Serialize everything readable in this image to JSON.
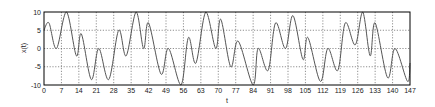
{
  "chart_data": {
    "type": "line",
    "title": "",
    "xlabel": "t",
    "ylabel": "x(t)",
    "xlim": [
      0,
      147
    ],
    "ylim": [
      -10,
      10
    ],
    "grid": true,
    "legend": null,
    "xticks": [
      0,
      7,
      14,
      21,
      28,
      35,
      42,
      49,
      56,
      63,
      70,
      77,
      84,
      91,
      98,
      105,
      112,
      119,
      126,
      133,
      140,
      147
    ],
    "yticks": [
      -10,
      -5,
      0,
      5,
      10
    ],
    "series": [
      {
        "name": "x(t)",
        "color": "#555555",
        "x": [
          0,
          2,
          5,
          9,
          13,
          15,
          19,
          22,
          26,
          30,
          33,
          37,
          40,
          42,
          47,
          50,
          55,
          58,
          61,
          65,
          69,
          71,
          75,
          78,
          84,
          86,
          90,
          93,
          97,
          100,
          104,
          106,
          111,
          114,
          118,
          121,
          125,
          128,
          131,
          133,
          138,
          141,
          146,
          147
        ],
        "y": [
          5,
          7,
          0,
          10,
          -2,
          4,
          -8.5,
          0,
          -8.5,
          5,
          -2,
          10,
          0,
          7,
          -7,
          0,
          -10,
          3,
          -4,
          10,
          0,
          8,
          -5,
          2,
          -10,
          0,
          -6,
          7,
          0,
          9,
          -3,
          3,
          -9,
          0,
          -6,
          7,
          1,
          10,
          -2,
          7,
          -8,
          0,
          -9,
          -4
        ]
      }
    ]
  },
  "axes": {
    "ylabel": "x(t)",
    "xlabel": "t"
  }
}
